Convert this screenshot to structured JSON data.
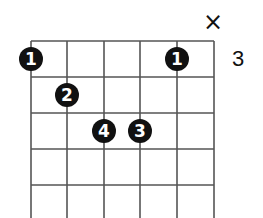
{
  "diagram": {
    "type": "guitar-chord-diagram",
    "strings": 6,
    "string_x": [
      31,
      67,
      104,
      140,
      177,
      214
    ],
    "fret_y": [
      41,
      77,
      113,
      149,
      185,
      221
    ],
    "base_fret_label": "3",
    "muted_marker": "×",
    "muted_string_index": 5,
    "fingers": [
      {
        "label": "1",
        "string_index": 0,
        "fret_row": 0
      },
      {
        "label": "1",
        "string_index": 4,
        "fret_row": 0
      },
      {
        "label": "2",
        "string_index": 1,
        "fret_row": 1
      },
      {
        "label": "4",
        "string_index": 2,
        "fret_row": 2
      },
      {
        "label": "3",
        "string_index": 3,
        "fret_row": 2
      }
    ],
    "colors": {
      "line": "#555555",
      "dot": "#111111",
      "dot_text": "#ffffff",
      "background": "#ffffff"
    }
  }
}
